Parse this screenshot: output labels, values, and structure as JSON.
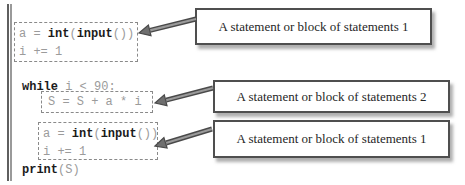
{
  "labels": {
    "annotation1": "A statement or block of statements 1",
    "annotation2": "A statement or block of statements 2",
    "annotation3": "A statement or block of statements 1"
  },
  "code": {
    "assign_pre": "a = ",
    "kw_int": "int",
    "open_paren": "(",
    "kw_input": "input",
    "assign_post": "())",
    "increment": "i += 1",
    "kw_while": "while",
    "while_cond": " i < 90:",
    "loop_body": "S = S + a * i",
    "kw_print": "print",
    "print_arg": "(S)"
  },
  "colors": {
    "code_text": "#9b9b9b",
    "keyword_text": "#1b1b1b",
    "dashed_border": "#8a8a8a",
    "annotation_border": "#4f4f4f",
    "arrow_fill": "#6f6f6f",
    "arrow_outline": "#4a4a4a",
    "background": "#ffffff"
  }
}
